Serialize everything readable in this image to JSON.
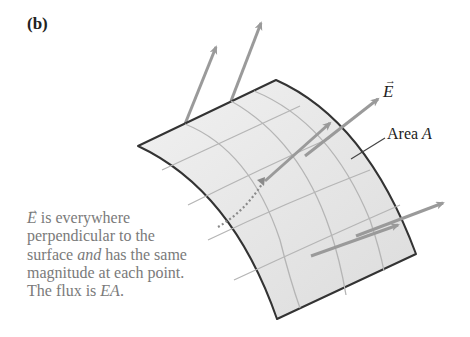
{
  "panel": {
    "label": "(b)"
  },
  "labels": {
    "field_symbol": "E",
    "vector_arrow": "→",
    "area_prefix": "Area ",
    "area_symbol": "A"
  },
  "caption": {
    "line1_rest": " is everywhere",
    "line2": "perpendicular to the",
    "line3_a": "surface ",
    "line3_em": "and",
    "line3_b": " has the same",
    "line4": "magnitude at each point.",
    "line5_a": "The flux is ",
    "line5_em": "EA",
    "line5_b": "."
  },
  "colors": {
    "surface_fill": "#e6e6e6",
    "surface_edge": "#333333",
    "grid": "#b5b5b5",
    "arrow": "#9a9a9a",
    "caption_text": "#7a7a7a"
  }
}
